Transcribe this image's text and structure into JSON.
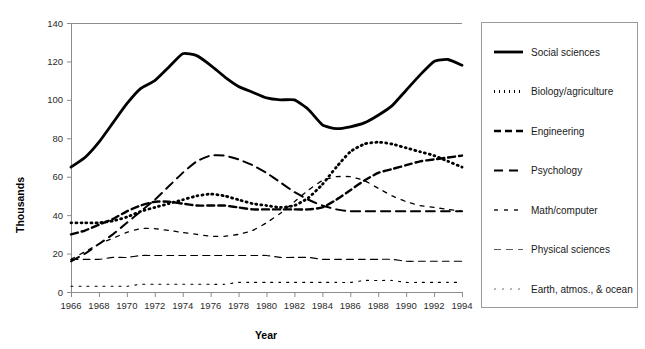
{
  "chart_data": {
    "type": "line",
    "title": "",
    "xlabel": "Year",
    "ylabel": "Thousands",
    "xlim": [
      1966,
      1994
    ],
    "ylim": [
      0,
      140
    ],
    "grid": false,
    "legend_position": "right",
    "x": [
      1966,
      1967,
      1968,
      1969,
      1970,
      1971,
      1972,
      1973,
      1974,
      1975,
      1976,
      1977,
      1978,
      1979,
      1980,
      1981,
      1982,
      1983,
      1984,
      1985,
      1986,
      1987,
      1988,
      1989,
      1990,
      1991,
      1992,
      1993,
      1994
    ],
    "xticks": [
      1966,
      1968,
      1970,
      1972,
      1974,
      1976,
      1978,
      1980,
      1982,
      1984,
      1986,
      1988,
      1990,
      1992,
      1994
    ],
    "xtick_labels": [
      "1966",
      "1968",
      "1970",
      "1972",
      "1974",
      "1976",
      "1978",
      "1980",
      "1982",
      "1984",
      "1986",
      "1988",
      "1990",
      "1992",
      "1994"
    ],
    "yticks": [
      0,
      20,
      40,
      60,
      80,
      100,
      120,
      140
    ],
    "ytick_labels": [
      "0",
      "20",
      "40",
      "60",
      "80",
      "100",
      "120",
      "140"
    ],
    "series": [
      {
        "name": "Social sciences",
        "style": "solid",
        "width": 2.8,
        "dash": "none",
        "color": "#000000",
        "values": [
          65,
          70,
          78,
          88,
          98,
          106,
          110,
          117,
          124,
          123,
          118,
          112,
          107,
          104,
          101,
          100,
          100,
          95,
          87,
          85,
          86,
          88,
          92,
          97,
          105,
          113,
          120,
          121,
          118
        ]
      },
      {
        "name": "Biology/agriculture",
        "style": "dotted",
        "width": 2.8,
        "dash": "1,4",
        "color": "#000000",
        "values": [
          36,
          36,
          36,
          37,
          39,
          42,
          44,
          46,
          48,
          50,
          51,
          50,
          48,
          46,
          45,
          44,
          45,
          49,
          56,
          65,
          73,
          77,
          78,
          77,
          75,
          73,
          71,
          68,
          65
        ]
      },
      {
        "name": "Engineering",
        "style": "dashed-thick",
        "width": 2.4,
        "dash": "7,4",
        "color": "#000000",
        "values": [
          30,
          32,
          35,
          38,
          42,
          45,
          47,
          47,
          46,
          45,
          45,
          45,
          44,
          43,
          43,
          43,
          43,
          43,
          44,
          48,
          53,
          58,
          62,
          64,
          66,
          68,
          69,
          70,
          71
        ]
      },
      {
        "name": "Psychology",
        "style": "dashed-medium",
        "width": 2.0,
        "dash": "9,6",
        "color": "#000000",
        "values": [
          16,
          20,
          25,
          30,
          36,
          42,
          48,
          55,
          62,
          68,
          71,
          71,
          69,
          66,
          62,
          57,
          52,
          48,
          45,
          43,
          42,
          42,
          42,
          42,
          42,
          42,
          42,
          42,
          42
        ]
      },
      {
        "name": "Math/computer",
        "style": "dashed-thin",
        "width": 1.3,
        "dash": "4,6",
        "color": "#1a1a1a",
        "values": [
          17,
          21,
          25,
          28,
          31,
          33,
          33,
          32,
          31,
          30,
          29,
          29,
          30,
          32,
          36,
          41,
          47,
          53,
          58,
          60,
          60,
          58,
          54,
          50,
          47,
          45,
          44,
          43,
          42
        ]
      },
      {
        "name": "Physical sciences",
        "style": "dashed-long-thin",
        "width": 1.1,
        "dash": "7,5",
        "color": "#5a5a5a",
        "values": [
          17,
          17,
          17,
          18,
          18,
          19,
          19,
          19,
          19,
          19,
          19,
          19,
          19,
          19,
          19,
          18,
          18,
          18,
          17,
          17,
          17,
          17,
          17,
          17,
          16,
          16,
          16,
          16,
          16
        ]
      },
      {
        "name": "Earth, atmos., & ocean",
        "style": "dotted-thin",
        "width": 1.1,
        "dash": "2,6",
        "color": "#6b6b6b",
        "values": [
          3,
          3,
          3,
          3,
          3,
          4,
          4,
          4,
          4,
          4,
          4,
          4,
          5,
          5,
          5,
          5,
          5,
          5,
          5,
          5,
          5,
          6,
          6,
          6,
          5,
          5,
          5,
          5,
          5
        ]
      }
    ]
  },
  "legend": {
    "items": [
      {
        "label": "Social sciences"
      },
      {
        "label": "Biology/agriculture"
      },
      {
        "label": "Engineering"
      },
      {
        "label": "Psychology"
      },
      {
        "label": "Math/computer"
      },
      {
        "label": "Physical sciences"
      },
      {
        "label": "Earth, atmos., & ocean"
      }
    ]
  }
}
